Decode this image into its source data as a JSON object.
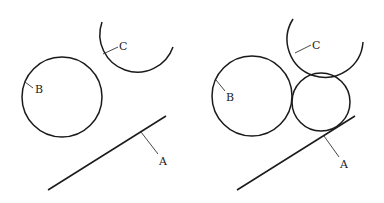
{
  "diagram": {
    "left_panel": {
      "labels": {
        "A": "A",
        "B": "B",
        "C": "C"
      },
      "shapes": [
        {
          "id": "A",
          "type": "line",
          "from": [
            48,
            190
          ],
          "to": [
            166,
            116
          ]
        },
        {
          "id": "B",
          "type": "circle",
          "center": [
            62,
            97
          ],
          "r": 40
        },
        {
          "id": "C",
          "type": "arc",
          "center": [
            139,
            39
          ],
          "r": 37
        }
      ]
    },
    "right_panel": {
      "labels": {
        "A": "A",
        "B": "B",
        "C": "C"
      },
      "shapes": [
        {
          "id": "A",
          "type": "line",
          "from": [
            237,
            190
          ],
          "to": [
            355,
            116
          ]
        },
        {
          "id": "B",
          "type": "circle",
          "center": [
            252,
            96
          ],
          "r": 40
        },
        {
          "id": "C",
          "type": "arc",
          "center": [
            327,
            35
          ],
          "r": 38
        },
        {
          "id": "tangent",
          "type": "circle",
          "center": [
            321,
            102
          ],
          "r": 29,
          "note": "unlabeled circle tangent to A, B and C"
        }
      ]
    }
  }
}
